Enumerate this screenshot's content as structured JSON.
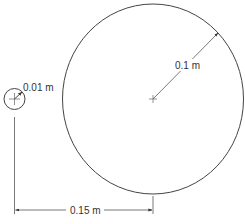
{
  "diagram": {
    "type": "two-circle geometry with dimensions",
    "colors": {
      "background": "#ffffff",
      "line": "#444444",
      "text": "#333333"
    },
    "small_circle": {
      "center": [
        14.5,
        99
      ],
      "radius_px": 10.5,
      "label": "0.01 m",
      "dimension": "radius"
    },
    "large_circle": {
      "center": [
        153,
        99
      ],
      "radius_px": [
        90.5,
        95
      ],
      "label": "0.1 m",
      "dimension": "radius"
    },
    "center_distance": {
      "label": "0.15 m",
      "from": "small circle center",
      "to": "large circle center"
    }
  }
}
